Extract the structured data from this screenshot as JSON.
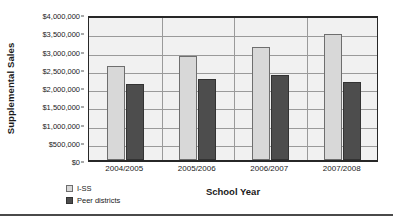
{
  "chart_data": {
    "type": "bar",
    "title": "",
    "xlabel": "School Year",
    "ylabel": "Supplemental Sales",
    "categories": [
      "2004/2005",
      "2005/2006",
      "2006/2007",
      "2007/2008"
    ],
    "series": [
      {
        "name": "I-SS",
        "color": "#d8d8d8",
        "values": [
          2570000,
          2850000,
          3110000,
          3450000
        ]
      },
      {
        "name": "Peer districts",
        "color": "#4d4d4d",
        "values": [
          2070000,
          2230000,
          2340000,
          2130000
        ]
      }
    ],
    "ylim": [
      0,
      4000000
    ],
    "ytick_values": [
      0,
      500000,
      1000000,
      1500000,
      2000000,
      2500000,
      3000000,
      3500000,
      4000000
    ],
    "ytick_labels": [
      "$0",
      "$500,000",
      "$1,000,000",
      "$1,500,000",
      "$2,000,000",
      "$2,500,000",
      "$3,000,000",
      "$3,500,000",
      "$4,000,000"
    ],
    "grid": true,
    "legend_position": "bottom-left",
    "plot_background": "#f1f1f1",
    "gridline_color": "#9a9a9a",
    "axis_color": "#272727"
  }
}
